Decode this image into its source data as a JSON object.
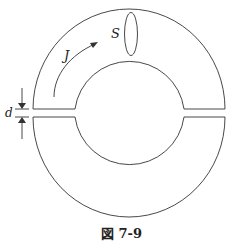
{
  "figure": {
    "caption": "図 7-9",
    "labels": {
      "current_density": "J",
      "cross_section": "S",
      "gap_width": "d"
    },
    "line_color": "#333333"
  }
}
